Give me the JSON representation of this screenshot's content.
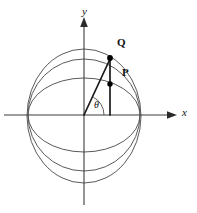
{
  "figure": {
    "background_color": "#ffffff",
    "width": 197,
    "height": 213
  },
  "axes": {
    "y_axis": {
      "label": "y",
      "icon": "arrow-up-icon",
      "x": 84,
      "top_y": 20,
      "bottom_y": 205,
      "label_x": 83,
      "label_y": 8,
      "color": "#3c3c3c"
    },
    "x_axis": {
      "label": "x",
      "icon": "arrow-right-icon",
      "y": 115,
      "left_x": 4,
      "right_x": 176,
      "label_x": 182,
      "label_y": 108,
      "color": "#3c3c3c"
    },
    "origin": {
      "x": 84,
      "y": 115
    }
  },
  "sphere": {
    "outline": {
      "name": "sphere-great-circle",
      "cx": 84,
      "cy": 115,
      "r": 56,
      "color": "#5a5a5a"
    },
    "meridian_ellipse": {
      "name": "sphere-meridian-ellipse",
      "cx": 84,
      "cy": 116,
      "rx": 57,
      "ry": 67,
      "color": "#5a5a5a"
    },
    "latitude_ellipse": {
      "name": "sphere-latitude-ellipse",
      "cx": 84,
      "cy": 115,
      "rx": 56,
      "ry": 37,
      "color": "#5a5a5a"
    }
  },
  "points": [
    {
      "id": "Q",
      "label": "Q",
      "x": 110,
      "y": 58,
      "label_x": 118,
      "label_y": 38,
      "radius": 2.6,
      "color": "#000000"
    },
    {
      "id": "P",
      "label": "P",
      "x": 110,
      "y": 84,
      "label_x": 122,
      "label_y": 68,
      "radius": 2.6,
      "color": "#000000"
    }
  ],
  "segments": {
    "radius_to_q": {
      "name": "radius-segment-origin-to-q",
      "x1": 84,
      "y1": 115,
      "x2": 110,
      "y2": 58,
      "color": "#1a1a1a"
    },
    "vertical_drop": {
      "name": "vertical-segment-axis-to-q",
      "x1": 110,
      "y1": 115,
      "x2": 110,
      "y2": 58,
      "color": "#1a1a1a"
    }
  },
  "angle": {
    "name": "theta",
    "label": "θ",
    "label_x": 94,
    "label_y": 101,
    "arc_radius": 20,
    "color": "#4a4a4a"
  }
}
